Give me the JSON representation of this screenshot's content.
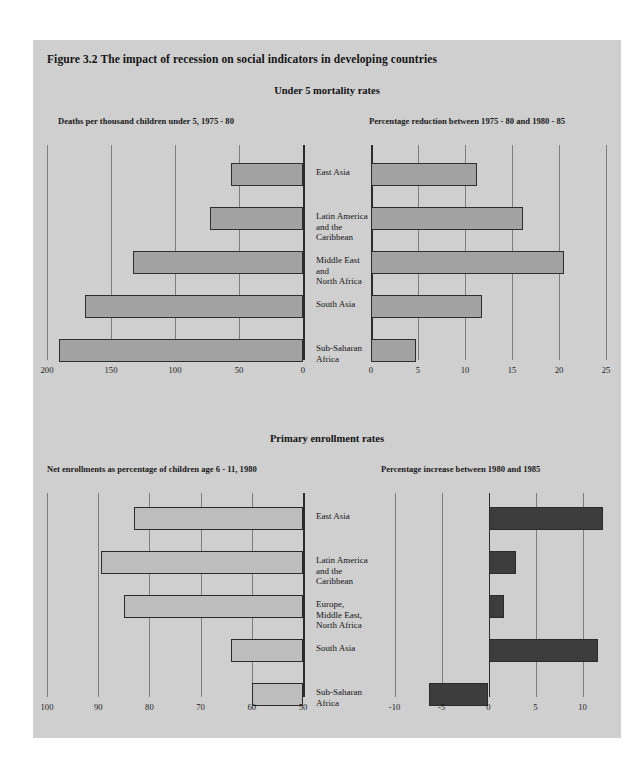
{
  "figure": {
    "title": "Figure 3.2  The impact of recession on social indicators in developing countries"
  },
  "panels": [
    {
      "title": "Under 5 mortality rates",
      "left_subtitle": "Deaths per thousand children under 5, 1975 - 80",
      "right_subtitle": "Percentage reduction between 1975 - 80 and 1980 - 85"
    },
    {
      "title": "Primary enrollment rates",
      "left_subtitle": "Net enrollments as percentage of children age 6 - 11, 1980",
      "right_subtitle": "Percentage increase between 1980 and 1985"
    }
  ],
  "chart_data": [
    {
      "id": "mortality-levels",
      "type": "bar",
      "orientation": "horizontal",
      "title": "Deaths per thousand children under 5, 1975 - 80",
      "xlabel": "",
      "ylabel": "",
      "categories": [
        "East Asia",
        "Latin America\nand the\nCaribbean",
        "Middle East\nand\nNorth Africa",
        "South Asia",
        "Sub-Saharan\nAfrica"
      ],
      "values": [
        56,
        73,
        133,
        170,
        191
      ],
      "xlim": [
        200,
        0
      ],
      "reversed_axis": true,
      "ticks": [
        200,
        150,
        100,
        50,
        0
      ],
      "tick_labels": [
        "200",
        "150",
        "100",
        "50",
        "0"
      ],
      "grid": true,
      "legend": "none",
      "bar_color": "#a2a2a2"
    },
    {
      "id": "mortality-reduction",
      "type": "bar",
      "orientation": "horizontal",
      "title": "Percentage reduction between 1975 - 80 and 1980 - 85",
      "xlabel": "",
      "ylabel": "",
      "categories": [
        "East Asia",
        "Latin America\nand the\nCaribbean",
        "Middle East\nand\nNorth Africa",
        "South Asia",
        "Sub-Saharan\nAfrica"
      ],
      "values": [
        11.3,
        16.2,
        20.5,
        11.8,
        4.8
      ],
      "xlim": [
        0,
        25
      ],
      "ticks": [
        0,
        5,
        10,
        15,
        20,
        25
      ],
      "tick_labels": [
        "0",
        "5",
        "10",
        "15",
        "20",
        "25"
      ],
      "grid": true,
      "legend": "none",
      "bar_color": "#a2a2a2"
    },
    {
      "id": "enrollment-levels",
      "type": "bar",
      "orientation": "horizontal",
      "title": "Net enrollments as percentage of children age 6 - 11, 1980",
      "xlabel": "",
      "ylabel": "",
      "categories": [
        "East Asia",
        "Latin America\nand the\nCaribbean",
        "Europe,\nMiddle East,\nNorth Africa",
        "South Asia",
        "Sub-Saharan\nAfrica"
      ],
      "values": [
        83,
        89.5,
        85,
        64,
        60
      ],
      "xlim": [
        100,
        50
      ],
      "reversed_axis": true,
      "ticks": [
        100,
        90,
        80,
        70,
        60,
        50
      ],
      "tick_labels": [
        "100",
        "90",
        "80",
        "70",
        "60",
        "50"
      ],
      "grid": true,
      "legend": "none",
      "bar_color": "#bdbdbd"
    },
    {
      "id": "enrollment-increase",
      "type": "bar",
      "orientation": "horizontal",
      "title": "Percentage increase between 1980 and 1985",
      "xlabel": "",
      "ylabel": "",
      "categories": [
        "East Asia",
        "Latin America\nand the\nCaribbean",
        "Europe,\nMiddle East,\nNorth Africa",
        "South Asia",
        "Sub-Saharan\nAfrica"
      ],
      "values": [
        12.2,
        2.9,
        1.7,
        11.6,
        -6.3
      ],
      "xlim": [
        -12.5,
        12.5
      ],
      "ticks": [
        -10,
        -5,
        0,
        5,
        10
      ],
      "tick_labels": [
        "-10",
        "-5",
        "0",
        "5",
        "10"
      ],
      "grid": true,
      "legend": "none",
      "bar_color": "#3d3d3d"
    }
  ]
}
